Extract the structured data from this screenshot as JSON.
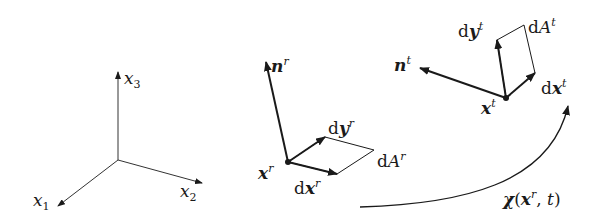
{
  "diagram": {
    "type": "continuum-mechanics-deformation-map",
    "axes": {
      "x1": {
        "base": "x",
        "sub": "1"
      },
      "x2": {
        "base": "x",
        "sub": "2"
      },
      "x3": {
        "base": "x",
        "sub": "3"
      }
    },
    "reference": {
      "normal": {
        "base": "n",
        "sup": "r"
      },
      "point": {
        "base": "x",
        "sup": "r"
      },
      "dy": {
        "d": "d",
        "base": "y",
        "sup": "r"
      },
      "dx": {
        "d": "d",
        "base": "x",
        "sup": "r"
      },
      "area": {
        "d": "d",
        "base": "A",
        "sup": "r"
      }
    },
    "current": {
      "normal": {
        "base": "n",
        "sup": "t"
      },
      "point": {
        "base": "x",
        "sup": "t"
      },
      "dy": {
        "d": "d",
        "base": "y",
        "sup": "t"
      },
      "dx": {
        "d": "d",
        "base": "x",
        "sup": "t"
      },
      "area": {
        "d": "d",
        "base": "A",
        "sup": "t"
      }
    },
    "mapping": {
      "func": "χ",
      "open": "(",
      "arg": "x",
      "arg_sup": "r",
      "sep": ", ",
      "t": "t",
      "close": ")"
    },
    "colors": {
      "stroke": "#1a1a1a",
      "background": "#ffffff"
    }
  }
}
